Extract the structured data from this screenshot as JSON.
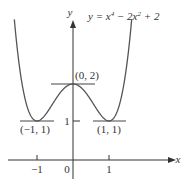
{
  "figure": {
    "equation": "y = x⁴ − 2x² + 2",
    "equation_parts": {
      "lhs": "y = x",
      "exp1": "4",
      "mid": " − 2x",
      "exp2": "2",
      "rhs": " + 2"
    },
    "axes": {
      "x_label": "x",
      "y_label": "y"
    },
    "x_ticks": [
      "−1",
      "0",
      "1"
    ],
    "y_ticks": [
      "1"
    ],
    "points": [
      {
        "label": "(0, 2)",
        "x": 0,
        "y": 2
      },
      {
        "label": "(−1, 1)",
        "x": -1,
        "y": 1
      },
      {
        "label": "(1, 1)",
        "x": 1,
        "y": 1
      }
    ],
    "colors": {
      "curve": "#555555",
      "axis": "#333333"
    }
  }
}
